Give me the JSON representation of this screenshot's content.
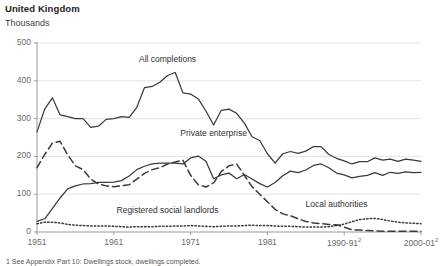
{
  "header": {
    "title": "United Kingdom",
    "subtitle": "Thousands"
  },
  "footnote": "1 See Appendix Part 10: Dwellings stock, dwellings completed.",
  "colors": {
    "line": "#3a3a3a",
    "grid": "#e3e3e3",
    "axis": "#9a9a9a",
    "tick_text": "#6a6a6a",
    "title_text": "#222222"
  },
  "chart_data": {
    "type": "line",
    "title": "United Kingdom",
    "subtitle": "Thousands",
    "xlabel": "",
    "ylabel": "Thousands",
    "ylim": [
      0,
      500
    ],
    "yticks": [
      0,
      100,
      200,
      300,
      400,
      500
    ],
    "ytick_labels": [
      "0",
      "100",
      "200",
      "300",
      "400",
      "500"
    ],
    "xlim": [
      1951,
      2001
    ],
    "xticks": [
      1951,
      1961,
      1971,
      1981,
      1991,
      2001
    ],
    "xtick_labels": [
      "1951",
      "1961",
      "1971",
      "1981",
      "1990-91",
      "2000-01"
    ],
    "xtick_superscripts": [
      "",
      "",
      "",
      "",
      "2",
      "2"
    ],
    "grid": true,
    "legend": "inline-annotations",
    "annotations": [
      {
        "text": "All completions",
        "x": 1968,
        "y": 455
      },
      {
        "text": "Private enterprise",
        "x": 1974,
        "y": 258
      },
      {
        "text": "Registered social landlords",
        "x": 1968,
        "y": 55
      },
      {
        "text": "Local authorities",
        "x": 1990,
        "y": 72
      }
    ],
    "x": [
      1951,
      1952,
      1953,
      1954,
      1955,
      1956,
      1957,
      1958,
      1959,
      1960,
      1961,
      1962,
      1963,
      1964,
      1965,
      1966,
      1967,
      1968,
      1969,
      1970,
      1971,
      1972,
      1973,
      1974,
      1975,
      1976,
      1977,
      1978,
      1979,
      1980,
      1981,
      1982,
      1983,
      1984,
      1985,
      1986,
      1987,
      1988,
      1989,
      1990,
      1991,
      1992,
      1993,
      1994,
      1995,
      1996,
      1997,
      1998,
      1999,
      2000,
      2001
    ],
    "series": [
      {
        "name": "All completions",
        "style": "solid",
        "values": [
          265,
          325,
          355,
          310,
          305,
          300,
          300,
          277,
          280,
          298,
          300,
          305,
          303,
          330,
          382,
          385,
          396,
          414,
          422,
          368,
          365,
          352,
          320,
          283,
          322,
          325,
          314,
          288,
          252,
          242,
          207,
          182,
          207,
          213,
          208,
          214,
          226,
          226,
          205,
          195,
          188,
          180,
          186,
          186,
          196,
          190,
          193,
          187,
          193,
          190,
          187
        ]
      },
      {
        "name": "Private enterprise",
        "style": "solid",
        "values": [
          28,
          35,
          62,
          90,
          114,
          122,
          127,
          128,
          131,
          131,
          132,
          136,
          148,
          165,
          174,
          180,
          182,
          182,
          182,
          180,
          196,
          201,
          187,
          141,
          151,
          156,
          141,
          152,
          140,
          128,
          119,
          131,
          149,
          161,
          157,
          164,
          176,
          180,
          170,
          156,
          151,
          143,
          147,
          150,
          157,
          150,
          158,
          155,
          159,
          157,
          158
        ]
      },
      {
        "name": "Local authorities",
        "style": "dashed",
        "values": [
          170,
          205,
          235,
          240,
          204,
          175,
          165,
          140,
          127,
          122,
          120,
          122,
          125,
          140,
          155,
          165,
          170,
          180,
          185,
          190,
          150,
          125,
          119,
          130,
          160,
          175,
          180,
          150,
          120,
          100,
          80,
          60,
          48,
          43,
          35,
          28,
          24,
          22,
          20,
          19,
          13,
          6,
          5,
          4,
          3,
          2,
          2,
          2,
          2,
          2,
          2
        ]
      },
      {
        "name": "Registered social landlords",
        "style": "dotted",
        "values": [
          22,
          26,
          26,
          24,
          20,
          18,
          17,
          16,
          16,
          16,
          15,
          14,
          13,
          14,
          14,
          14,
          15,
          15,
          16,
          16,
          17,
          16,
          15,
          14,
          15,
          16,
          16,
          17,
          18,
          17,
          17,
          16,
          15,
          15,
          14,
          13,
          13,
          13,
          14,
          17,
          21,
          27,
          33,
          35,
          36,
          33,
          29,
          26,
          24,
          23,
          22
        ]
      }
    ]
  }
}
